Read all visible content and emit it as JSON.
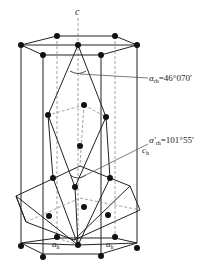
{
  "diagram": {
    "axis_label": "c",
    "annotations": [
      {
        "id": "alpha_rh",
        "symbol": "α",
        "subscript": "rh",
        "value": "=46°070′"
      },
      {
        "id": "alpha_rh_prime",
        "symbol": "α′",
        "subscript": "rh",
        "value": "=101°55′"
      },
      {
        "id": "c_h",
        "symbol": "c",
        "subscript": "h"
      },
      {
        "id": "a_h_left",
        "symbol": "a",
        "subscript": "h"
      },
      {
        "id": "a_h_right",
        "symbol": "a",
        "subscript": "h"
      }
    ],
    "colors": {
      "line": "#222222",
      "dashed": "#888888",
      "atom": "#111111",
      "background": "#ffffff"
    }
  }
}
